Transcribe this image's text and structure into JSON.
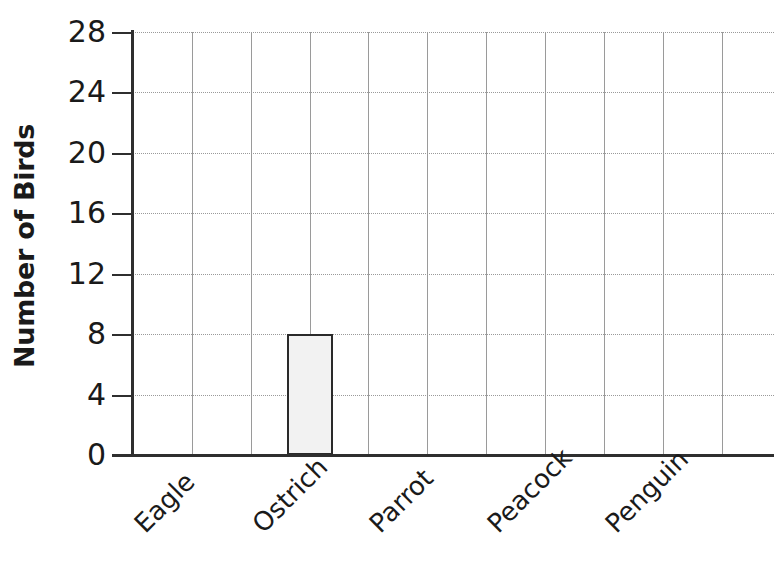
{
  "chart_data": {
    "type": "bar",
    "title": "",
    "subtitle": "",
    "xlabel": "",
    "ylabel": "Number of Birds",
    "categories": [
      "Eagle",
      "Ostrich",
      "Parrot",
      "Peacock",
      "Penguin"
    ],
    "values": [
      0,
      8,
      0,
      0,
      0
    ],
    "series": [
      {
        "name": "Number of Birds",
        "values": [
          0,
          8,
          0,
          0,
          0
        ]
      }
    ],
    "ylim": [
      0,
      28
    ],
    "ytick_labels": [
      "0",
      "4",
      "8",
      "12",
      "16",
      "20",
      "24",
      "28"
    ],
    "ytick_values": [
      0,
      4,
      8,
      12,
      16,
      20,
      24,
      28
    ],
    "ytick_step": 4,
    "grid": "both",
    "grid_horizontal_dotted": true,
    "grid_vertical_count": 11,
    "legend": "none",
    "legend_position": "none",
    "annotations": [],
    "bar_fill_color": "#f2f2f2",
    "bar_border_color": "#2a2a2a",
    "axis_color": "#2f2f2f",
    "grid_color": "#9a9a9a",
    "text_color": "#1a1a1a",
    "background_color": "#ffffff",
    "xlabel_rotation_degrees": -45
  }
}
